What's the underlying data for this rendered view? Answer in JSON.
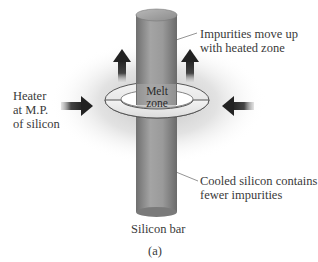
{
  "figure": {
    "panel_label": "(a)",
    "bar_label": "Silicon bar",
    "melt_zone": {
      "line1": "Melt",
      "line2": "zone"
    },
    "heater_label": {
      "line1": "Heater",
      "line2": "at M.P.",
      "line3": "of silicon"
    },
    "impurities_label": {
      "line1": "Impurities move up",
      "line2": "with heated zone"
    },
    "cooled_label": {
      "line1": "Cooled silicon contains",
      "line2": "fewer impurities"
    }
  },
  "icons": {
    "up_arrows": [
      "arrow-up-icon",
      "arrow-up-icon"
    ],
    "heater_arrows": [
      "arrow-right-icon",
      "arrow-left-icon"
    ]
  },
  "colors": {
    "bar_gray": "#8f8f8f",
    "ring_fill": "#efefef",
    "arrow_dark": "#2a2a2a",
    "glow": "#c8c8c8",
    "text": "#3a3a3a"
  }
}
